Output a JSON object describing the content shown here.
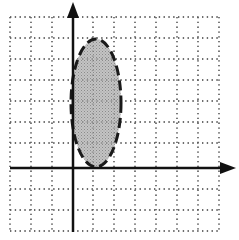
{
  "figure": {
    "grid": {
      "x_lines": [
        10,
        31,
        52,
        93,
        114,
        135,
        156,
        177,
        198,
        219
      ],
      "y_lines": [
        17,
        38,
        59,
        80,
        101,
        122,
        143,
        189,
        210,
        231
      ],
      "left": 10,
      "right": 219,
      "top": 17,
      "bottom": 231,
      "style": "dotted",
      "color": "#555555"
    },
    "axes": {
      "x_axis_y": 168,
      "y_axis_x": 73,
      "x_start": 10,
      "x_arrow_tip": 236,
      "y_start": 232,
      "y_arrow_tip": 2,
      "color": "#111111"
    },
    "ellipse": {
      "cx": 96,
      "cy": 103,
      "rx": 25,
      "ry": 64,
      "fill": "#b8b8b8",
      "stroke": "#1a1a1a",
      "stroke_style": "dashed"
    }
  }
}
